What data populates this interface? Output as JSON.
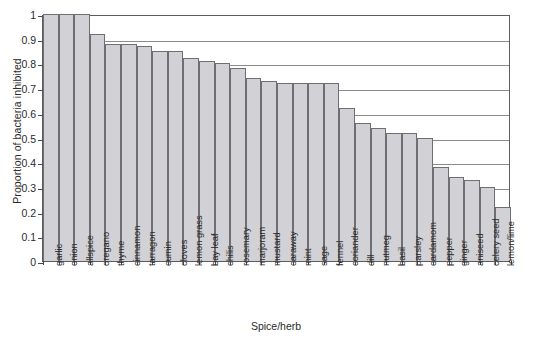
{
  "chart_data": {
    "type": "bar",
    "title": "",
    "xlabel": "Spice/herb",
    "ylabel": "Proportion of bacteria inhibited",
    "ylim": [
      0,
      1
    ],
    "yticks": [
      "0",
      "0.1",
      "0.2",
      "0.3",
      "0.4",
      "0.5",
      "0.6",
      "0.7",
      "0.8",
      "0.9",
      "1"
    ],
    "ytick_values": [
      0,
      0.1,
      0.2,
      0.3,
      0.4,
      0.5,
      0.6,
      0.7,
      0.8,
      0.9,
      1
    ],
    "grid": "horizontal",
    "legend": "none",
    "orientation": "vertical",
    "bar_fill_color": "#d2d2d6",
    "bar_edge_color": "#6e6e74",
    "categories": [
      "garlic",
      "onion",
      "allspice",
      "oregano",
      "thyme",
      "cinnamon",
      "tarragon",
      "cumin",
      "cloves",
      "lemon grass",
      "bay leaf",
      "chilis",
      "rosemary",
      "marjoram",
      "mustard",
      "caraway",
      "mint",
      "sage",
      "fennel",
      "coriander",
      "dill",
      "nutmeg",
      "basil",
      "parsley",
      "cardamom",
      "pepper",
      "ginger",
      "aniseed",
      "celery seed",
      "lemon/lime"
    ],
    "values": [
      1.0,
      1.0,
      1.0,
      0.92,
      0.88,
      0.88,
      0.87,
      0.85,
      0.85,
      0.82,
      0.81,
      0.8,
      0.78,
      0.74,
      0.73,
      0.72,
      0.72,
      0.72,
      0.72,
      0.62,
      0.56,
      0.54,
      0.52,
      0.52,
      0.5,
      0.38,
      0.34,
      0.33,
      0.3,
      0.22
    ]
  }
}
